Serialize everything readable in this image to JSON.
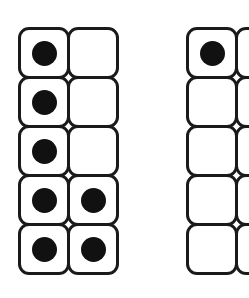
{
  "diagram": {
    "type": "ten-frames",
    "frames": [
      {
        "name": "left-frame",
        "left": 18,
        "columns": 2,
        "rows": 5,
        "filled": [
          [
            true,
            false
          ],
          [
            true,
            false
          ],
          [
            true,
            false
          ],
          [
            true,
            true
          ],
          [
            true,
            true
          ]
        ],
        "count": 7
      },
      {
        "name": "right-frame",
        "left": 186,
        "columns": 2,
        "rows": 5,
        "filled": [
          [
            true,
            false
          ],
          [
            false,
            false
          ],
          [
            false,
            false
          ],
          [
            false,
            false
          ],
          [
            false,
            false
          ]
        ],
        "count": 1
      }
    ],
    "colors": {
      "stroke": "#1a1a1a",
      "dot": "#111111",
      "background": "#ffffff"
    }
  }
}
